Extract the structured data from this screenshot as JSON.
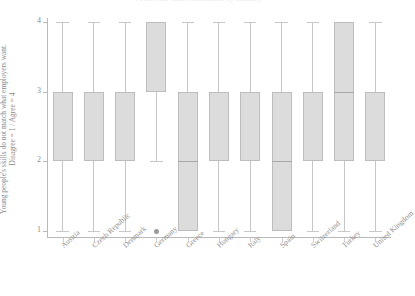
{
  "chart_data": {
    "type": "box",
    "title": "Perceived skills mismatch by country",
    "ylabel": "Young people's skills do not match what employers want.",
    "ylabel_sub": "Disagree = 1 / Agree = 4",
    "xlabel": "",
    "ylim": [
      1,
      4
    ],
    "yticks": [
      1,
      2,
      3,
      4
    ],
    "ytick_labels": [
      "1",
      "2",
      "3",
      "4"
    ],
    "grid": false,
    "legend": false,
    "box_fill": "#dcdcdc",
    "box_edge": "#bdbdbd",
    "whisker_color": "#c6c6c6",
    "outlier_color": "#9a9a9a",
    "categories": [
      "Austria",
      "Czech Republic",
      "Denmark",
      "Germany",
      "Greece",
      "Hungary",
      "Italy",
      "Spain",
      "Switzerland",
      "Turkey",
      "United Kingdom"
    ],
    "boxes": [
      {
        "label": "Austria",
        "whisker_low": 1,
        "q1": 2,
        "median": 2,
        "q3": 3,
        "whisker_high": 4,
        "outliers": []
      },
      {
        "label": "Czech Republic",
        "whisker_low": 1,
        "q1": 2,
        "median": 2,
        "q3": 3,
        "whisker_high": 4,
        "outliers": []
      },
      {
        "label": "Denmark",
        "whisker_low": 1,
        "q1": 2,
        "median": 2,
        "q3": 3,
        "whisker_high": 4,
        "outliers": []
      },
      {
        "label": "Germany",
        "whisker_low": 2,
        "q1": 3,
        "median": 3,
        "q3": 4,
        "whisker_high": 4,
        "outliers": [
          1
        ]
      },
      {
        "label": "Greece",
        "whisker_low": 1,
        "q1": 1,
        "median": 2,
        "q3": 3,
        "whisker_high": 4,
        "outliers": []
      },
      {
        "label": "Hungary",
        "whisker_low": 1,
        "q1": 2,
        "median": 2,
        "q3": 3,
        "whisker_high": 4,
        "outliers": []
      },
      {
        "label": "Italy",
        "whisker_low": 1,
        "q1": 2,
        "median": 2,
        "q3": 3,
        "whisker_high": 4,
        "outliers": []
      },
      {
        "label": "Spain",
        "whisker_low": 1,
        "q1": 1,
        "median": 2,
        "q3": 3,
        "whisker_high": 4,
        "outliers": []
      },
      {
        "label": "Switzerland",
        "whisker_low": 1,
        "q1": 2,
        "median": 2,
        "q3": 3,
        "whisker_high": 4,
        "outliers": []
      },
      {
        "label": "Turkey",
        "whisker_low": 1,
        "q1": 2,
        "median": 3,
        "q3": 4,
        "whisker_high": 4,
        "outliers": []
      },
      {
        "label": "United Kingdom",
        "whisker_low": 1,
        "q1": 2,
        "median": 2,
        "q3": 3,
        "whisker_high": 4,
        "outliers": []
      }
    ]
  }
}
